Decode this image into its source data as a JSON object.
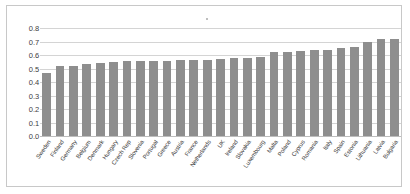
{
  "chart_data": {
    "type": "bar",
    "title": "",
    "xlabel": "",
    "ylabel": "",
    "ylim": [
      0,
      0.8
    ],
    "grid": true,
    "legend": null,
    "ytick_labels": [
      "0.8",
      "0.7",
      "0.6",
      "0.5",
      "0.4",
      "0.3",
      "0.2",
      "0.1",
      "0.0"
    ],
    "ytick_values": [
      0.8,
      0.7,
      0.6,
      0.5,
      0.4,
      0.3,
      0.2,
      0.1,
      0.0
    ],
    "bar_color": "#8e8e8e",
    "gridline_color": "#d4d4d4",
    "categories": [
      "Sweden",
      "Finland",
      "Germany",
      "Belgium",
      "Denmark",
      "Hungary",
      "Czech Rep",
      "Slovenia",
      "Portugal",
      "Greece",
      "Austria",
      "France",
      "Netherlands",
      "UK",
      "Ireland",
      "Slovakia",
      "Luxembourg",
      "Malta",
      "Poland",
      "Cyprus",
      "Romania",
      "Italy",
      "Spain",
      "Estonia",
      "Lithuania",
      "Latvia",
      "Bulgaria"
    ],
    "values": [
      0.47,
      0.52,
      0.52,
      0.53,
      0.54,
      0.545,
      0.555,
      0.555,
      0.555,
      0.555,
      0.565,
      0.565,
      0.565,
      0.57,
      0.575,
      0.58,
      0.585,
      0.62,
      0.625,
      0.63,
      0.635,
      0.64,
      0.65,
      0.66,
      0.695,
      0.715,
      0.72
    ]
  }
}
